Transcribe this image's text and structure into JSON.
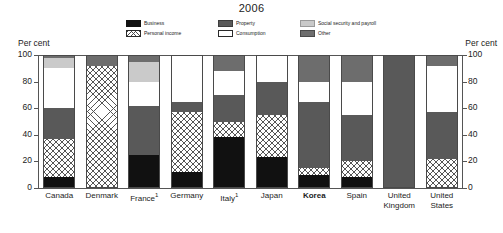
{
  "title": "2006",
  "axis": {
    "left_caption": "Per cent",
    "right_caption": "Per cent",
    "ticks": [
      "100",
      "80",
      "60",
      "40",
      "20",
      "0"
    ]
  },
  "legend": {
    "columns": [
      [
        {
          "label": "Business",
          "key": "business",
          "color": "#121212"
        },
        {
          "label": "Personal income",
          "key": "personal",
          "color": "#ffffff"
        }
      ],
      [
        {
          "label": "Property",
          "key": "property",
          "color": "#5a5a5a"
        },
        {
          "label": "Consumption",
          "key": "consumption",
          "color": "#ffffff"
        }
      ],
      [
        {
          "label": "Social security and payroll",
          "key": "social",
          "color": "#c9c9c9"
        },
        {
          "label": "Other",
          "key": "other",
          "color": "#6e6e6e"
        }
      ]
    ]
  },
  "chart_data": {
    "type": "bar",
    "subtype": "stacked-100-percent",
    "title": "2006",
    "xlabel": "",
    "ylabel": "Per cent",
    "ylim": [
      0,
      100
    ],
    "yticks": [
      0,
      20,
      40,
      60,
      80,
      100
    ],
    "grid": false,
    "legend_position": "top-center",
    "categories": [
      "Canada",
      "Denmark",
      "France¹",
      "Germany",
      "Italy¹",
      "Japan",
      "Korea",
      "Spain",
      "United Kingdom",
      "United States"
    ],
    "category_labels": [
      {
        "text": "Canada",
        "footnote": "",
        "highlight": false
      },
      {
        "text": "Denmark",
        "footnote": "",
        "highlight": false
      },
      {
        "text": "France",
        "footnote": "1",
        "highlight": false
      },
      {
        "text": "Germany",
        "footnote": "",
        "highlight": false
      },
      {
        "text": "Italy",
        "footnote": "1",
        "highlight": false
      },
      {
        "text": "Japan",
        "footnote": "",
        "highlight": false
      },
      {
        "text": "Korea",
        "footnote": "",
        "highlight": true
      },
      {
        "text": "Spain",
        "footnote": "",
        "highlight": false
      },
      {
        "text": "United Kingdom",
        "footnote": "",
        "highlight": false
      },
      {
        "text": "United States",
        "footnote": "",
        "highlight": false
      }
    ],
    "stack_order_bottom_to_top": [
      "business",
      "personal",
      "property",
      "consumption",
      "social",
      "other"
    ],
    "series": [
      {
        "name": "Business",
        "key": "business",
        "color": "#111111",
        "values": [
          8,
          0,
          25,
          12,
          38,
          23,
          10,
          8,
          0,
          0
        ]
      },
      {
        "name": "Personal income",
        "key": "personal",
        "color": "#ffffff",
        "values": [
          29,
          92,
          0,
          45,
          12,
          32,
          5,
          12,
          0,
          22
        ]
      },
      {
        "name": "Property",
        "key": "property",
        "color": "#595959",
        "values": [
          23,
          0,
          37,
          8,
          20,
          25,
          50,
          35,
          100,
          35
        ]
      },
      {
        "name": "Consumption",
        "key": "consumption",
        "color": "#ffffff",
        "values": [
          30,
          0,
          18,
          35,
          18,
          20,
          15,
          25,
          0,
          35
        ]
      },
      {
        "name": "Social security and payroll",
        "key": "social",
        "color": "#cacaca",
        "values": [
          8,
          0,
          15,
          0,
          0,
          0,
          0,
          0,
          0,
          0
        ]
      },
      {
        "name": "Other",
        "key": "other",
        "color": "#6d6d6d",
        "values": [
          2,
          8,
          5,
          0,
          12,
          0,
          20,
          20,
          0,
          8
        ]
      }
    ]
  }
}
